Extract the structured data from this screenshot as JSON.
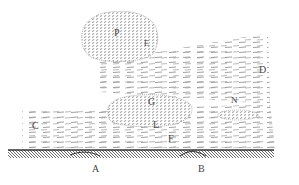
{
  "figure": {
    "type": "engraving-diagram",
    "ink_color": "#555555",
    "background": "#ffffff",
    "labels": [
      {
        "id": "P",
        "text": "P",
        "x": 117,
        "y": 33
      },
      {
        "id": "E",
        "text": "E",
        "x": 146,
        "y": 44
      },
      {
        "id": "D",
        "text": "D",
        "x": 262,
        "y": 69
      },
      {
        "id": "G",
        "text": "G",
        "x": 151,
        "y": 101
      },
      {
        "id": "N",
        "text": "N",
        "x": 233,
        "y": 98
      },
      {
        "id": "L",
        "text": "L",
        "x": 155,
        "y": 124
      },
      {
        "id": "F",
        "text": "F",
        "x": 170,
        "y": 138
      },
      {
        "id": "C",
        "text": "C",
        "x": 34,
        "y": 125
      },
      {
        "id": "A",
        "text": "A",
        "x": 94,
        "y": 163
      },
      {
        "id": "B",
        "text": "B",
        "x": 200,
        "y": 164
      }
    ],
    "regions": [
      {
        "name": "cloud-P",
        "description": "large round stippled cloud upper center"
      },
      {
        "name": "cloud-G",
        "description": "elongated stippled cloud middle"
      },
      {
        "name": "cloud-N",
        "description": "small flat stippled cloud right"
      },
      {
        "name": "wind-streams",
        "description": "dashed horizontal strokes indicating wind"
      },
      {
        "name": "ground",
        "description": "dark hatched ground strip at bottom"
      }
    ]
  }
}
